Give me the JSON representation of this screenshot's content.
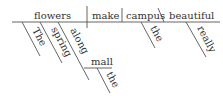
{
  "diagram": {
    "type": "sentence-diagram",
    "style": "Reed-Kellogg",
    "baseline": {
      "subject": "flowers",
      "verb": "make",
      "object": "campus",
      "object_complement": "beautiful"
    },
    "modifiers": {
      "subject": [
        "The",
        "spring"
      ],
      "prepositional_phrase": {
        "preposition": "along",
        "object": "mall",
        "object_modifier": "the"
      },
      "object": [
        "the"
      ],
      "object_complement": [
        "really"
      ]
    },
    "colors": {
      "line": "#555555",
      "text": "#333333",
      "background": "#ffffff"
    }
  }
}
